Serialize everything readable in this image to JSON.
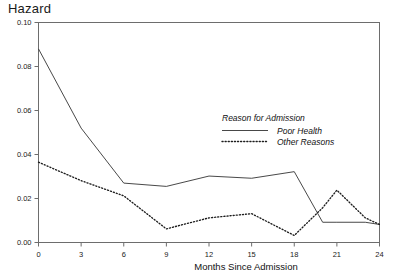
{
  "chart_data": {
    "type": "line",
    "title": "Hazard",
    "xlabel": "Months Since Admission",
    "ylabel": "Hazard",
    "xlim": [
      0,
      24
    ],
    "ylim": [
      0.0,
      0.1
    ],
    "grid": false,
    "legend_position": "inside-right-upper",
    "legend_title": "Reason for Admission",
    "xticks": [
      0,
      3,
      6,
      9,
      12,
      15,
      18,
      21,
      24
    ],
    "xtick_labels": [
      "0",
      "3",
      "6",
      "9",
      "12",
      "15",
      "18",
      "21",
      "24"
    ],
    "yticks": [
      0.0,
      0.02,
      0.04,
      0.06,
      0.08,
      0.1
    ],
    "ytick_labels": [
      "0.00",
      "0.02",
      "0.04",
      "0.06",
      "0.08",
      "0.10"
    ],
    "x": [
      0,
      3,
      6,
      9,
      12,
      15,
      18,
      20,
      21,
      23,
      24
    ],
    "series": [
      {
        "name": "Poor Health",
        "style": "solid",
        "values": [
          0.088,
          0.052,
          0.027,
          0.0255,
          0.0302,
          0.0292,
          0.0322,
          0.0092,
          0.0092,
          0.0092,
          0.0082
        ]
      },
      {
        "name": "Other Reasons",
        "style": "dotted",
        "values": [
          0.0365,
          0.0281,
          0.0212,
          0.0062,
          0.0112,
          0.0131,
          0.0032,
          0.0158,
          0.0238,
          0.0112,
          0.0082
        ]
      }
    ]
  },
  "legend": {
    "title": "Reason for Admission",
    "entries": [
      {
        "label": "Poor Health",
        "style": "solid"
      },
      {
        "label": "Other Reasons",
        "style": "dotted"
      }
    ]
  },
  "axes": {
    "y_title": "Hazard",
    "x_title": "Months Since Admission"
  }
}
